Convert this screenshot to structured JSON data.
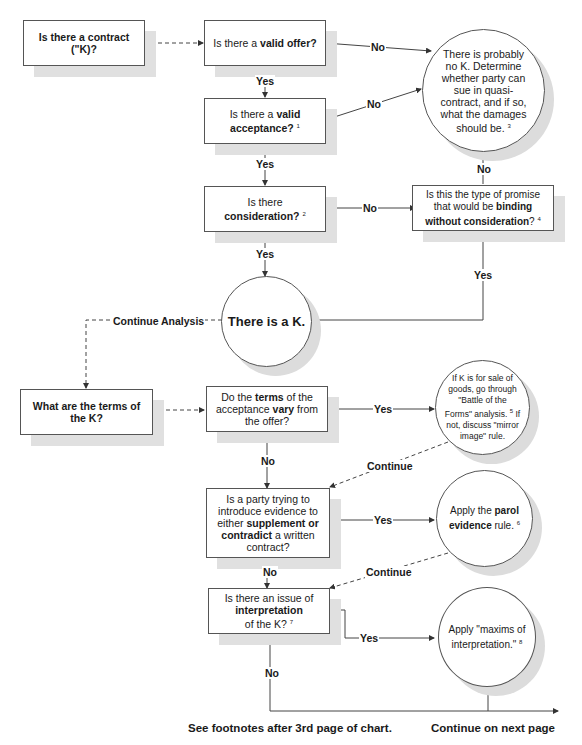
{
  "nodes": {
    "is_contract": {
      "text": "Is there a contract (\"K)?"
    },
    "valid_offer": {
      "pre": "Is there a ",
      "bold": "valid offer?",
      "post": ""
    },
    "valid_acceptance": {
      "pre": "Is there a ",
      "bold1": "valid",
      "bold2": "acceptance?",
      "sup": "1"
    },
    "consideration": {
      "pre": "Is there",
      "bold": "consideration?",
      "sup": "2"
    },
    "binding_without": {
      "pre": "Is this the type of promise that would be ",
      "bold1": "binding without",
      "bold2": "consideration",
      "post": "?",
      "sup": "4"
    },
    "no_k": {
      "text": "There is probably  no K. Determine whether party can sue in quasi-contract, and if so, what the damages should be.",
      "sup": "3"
    },
    "there_is_k": {
      "text": "There is a K."
    },
    "terms_of_k": {
      "text": "What are the terms of the K?"
    },
    "terms_vary": {
      "pre": "Do the ",
      "bold1": "terms",
      "mid": " of the acceptance ",
      "bold2": "vary",
      "post": " from the offer?"
    },
    "battle_forms": {
      "pre": "If K is for sale of goods, go through \"Battle of the Forms\" analysis.",
      "sup": "5",
      "post": " If not, discuss \"mirror image\" rule."
    },
    "parol_question": {
      "pre": "Is a party trying to introduce evidence to either ",
      "bold1": "supplement or contradict",
      "post": " a written contract?"
    },
    "parol_rule": {
      "pre": "Apply the ",
      "bold1": "parol evidence",
      "post": " rule.",
      "sup": "6"
    },
    "interpretation_q": {
      "pre": "Is there an issue of ",
      "bold1": "interpretation",
      "post": " of the K?",
      "sup": "7"
    },
    "maxims": {
      "text": "Apply \"maxims of interpretation.\"",
      "sup": "8"
    }
  },
  "edge_labels": {
    "no": "No",
    "yes": "Yes",
    "continue": "Continue",
    "continue_analysis": "Continue Analysis"
  },
  "footer": {
    "footnotes": "See footnotes after 3rd page of chart.",
    "next_page": "Continue on next page"
  }
}
